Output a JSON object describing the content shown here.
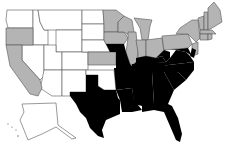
{
  "map": {
    "type": "choropleth",
    "region": "United States",
    "colors": {
      "black": "#000000",
      "gray": "#b4b4b4",
      "white": "#ffffff",
      "border": "#555555"
    },
    "categories": {
      "black": [
        "TX",
        "OK-panhandle-excluded",
        "AR",
        "LA",
        "MS",
        "AL",
        "GA",
        "FL",
        "SC",
        "NC",
        "TN",
        "KY",
        "VA",
        "WV",
        "MO",
        "MD",
        "DE"
      ],
      "gray": [
        "CA",
        "OR",
        "MN",
        "IA",
        "WI",
        "IL",
        "KS",
        "MI",
        "IN",
        "OH",
        "PA",
        "NY",
        "NJ",
        "CT",
        "RI",
        "MA",
        "VT",
        "NH",
        "ME"
      ],
      "white": [
        "WA",
        "ID",
        "MT",
        "WY",
        "NV",
        "UT",
        "CO",
        "AZ",
        "NM",
        "ND",
        "SD",
        "NE",
        "OK",
        "AK"
      ]
    }
  }
}
